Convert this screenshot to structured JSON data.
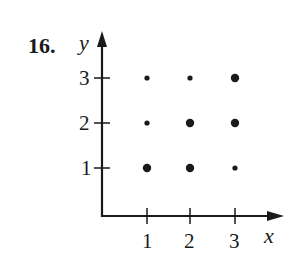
{
  "problem": {
    "number_label": "16."
  },
  "chart_data": {
    "type": "scatter",
    "title": "",
    "xlabel": "x",
    "ylabel": "y",
    "xticks": [
      "1",
      "2",
      "3"
    ],
    "yticks": [
      "1",
      "2",
      "3"
    ],
    "xlim": [
      0,
      3.5
    ],
    "ylim": [
      0,
      3.5
    ],
    "grid": false,
    "legend": null,
    "points": [
      {
        "x": 1,
        "y": 1,
        "in_relation": true
      },
      {
        "x": 2,
        "y": 1,
        "in_relation": true
      },
      {
        "x": 3,
        "y": 1,
        "in_relation": false
      },
      {
        "x": 1,
        "y": 2,
        "in_relation": false
      },
      {
        "x": 2,
        "y": 2,
        "in_relation": true
      },
      {
        "x": 3,
        "y": 2,
        "in_relation": true
      },
      {
        "x": 1,
        "y": 3,
        "in_relation": false
      },
      {
        "x": 2,
        "y": 3,
        "in_relation": false
      },
      {
        "x": 3,
        "y": 3,
        "in_relation": true
      }
    ],
    "series": [
      {
        "name": "in relation (large dots)",
        "points": [
          [
            1,
            1
          ],
          [
            2,
            1
          ],
          [
            2,
            2
          ],
          [
            3,
            2
          ],
          [
            3,
            3
          ]
        ]
      },
      {
        "name": "not in relation (small dots)",
        "points": [
          [
            3,
            1
          ],
          [
            1,
            2
          ],
          [
            1,
            3
          ],
          [
            2,
            3
          ]
        ]
      }
    ]
  },
  "style": {
    "ink_color": "#1a1a1a",
    "background": "#ffffff"
  }
}
